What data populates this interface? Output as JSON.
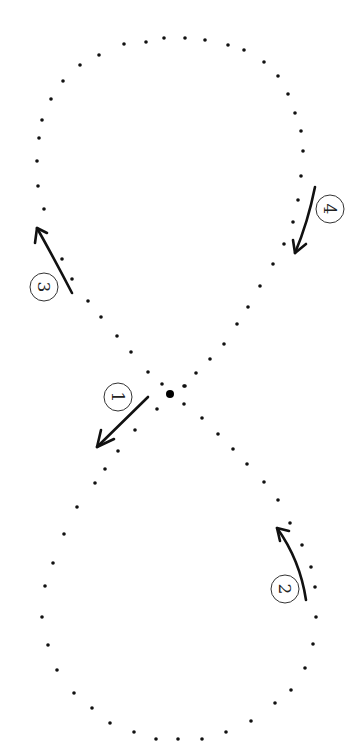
{
  "diagram": {
    "type": "figure-eight-path",
    "colors": {
      "ink": "#111111",
      "background": "#ffffff",
      "circle_stroke": "#333333"
    },
    "center_point": {
      "x": 170,
      "y": 394,
      "r": 4
    },
    "dot_radius": 1.8,
    "dots": [
      [
        124,
        44
      ],
      [
        146,
        42
      ],
      [
        164,
        38
      ],
      [
        185,
        38
      ],
      [
        205,
        40
      ],
      [
        228,
        45
      ],
      [
        244,
        50
      ],
      [
        264,
        62
      ],
      [
        278,
        76
      ],
      [
        288,
        94
      ],
      [
        295,
        113
      ],
      [
        301,
        131
      ],
      [
        303,
        151
      ],
      [
        301,
        176
      ],
      [
        298,
        200
      ],
      [
        293,
        222
      ],
      [
        284,
        244
      ],
      [
        273,
        264
      ],
      [
        260,
        286
      ],
      [
        248,
        307
      ],
      [
        237,
        324
      ],
      [
        224,
        344
      ],
      [
        210,
        359
      ],
      [
        196,
        373
      ],
      [
        184,
        386
      ],
      [
        99,
        55
      ],
      [
        80,
        65
      ],
      [
        63,
        81
      ],
      [
        51,
        99
      ],
      [
        42,
        120
      ],
      [
        39,
        138
      ],
      [
        37,
        161
      ],
      [
        38,
        186
      ],
      [
        44,
        209
      ],
      [
        62,
        259
      ],
      [
        72,
        279
      ],
      [
        88,
        301
      ],
      [
        101,
        317
      ],
      [
        117,
        336
      ],
      [
        131,
        352
      ],
      [
        148,
        372
      ],
      [
        162,
        384
      ],
      [
        185,
        386
      ],
      [
        184,
        404
      ],
      [
        157,
        409
      ],
      [
        135,
        430
      ],
      [
        118,
        451
      ],
      [
        105,
        469
      ],
      [
        95,
        483
      ],
      [
        77,
        507
      ],
      [
        64,
        534
      ],
      [
        53,
        563
      ],
      [
        202,
        418
      ],
      [
        218,
        434
      ],
      [
        233,
        449
      ],
      [
        247,
        464
      ],
      [
        264,
        482
      ],
      [
        278,
        500
      ],
      [
        290,
        523
      ],
      [
        302,
        545
      ],
      [
        311,
        567
      ],
      [
        45,
        586
      ],
      [
        42,
        617
      ],
      [
        48,
        645
      ],
      [
        57,
        670
      ],
      [
        74,
        693
      ],
      [
        92,
        708
      ],
      [
        110,
        723
      ],
      [
        134,
        732
      ],
      [
        156,
        739
      ],
      [
        178,
        739
      ],
      [
        202,
        739
      ],
      [
        226,
        732
      ],
      [
        251,
        721
      ],
      [
        275,
        703
      ],
      [
        291,
        690
      ],
      [
        305,
        668
      ],
      [
        313,
        644
      ],
      [
        316,
        617
      ],
      [
        315,
        587
      ]
    ],
    "markers": [
      {
        "id": "1",
        "label": "1",
        "cx": 118,
        "cy": 397,
        "rotate": 90,
        "arrow": {
          "path": "M 148 397 L 97 447",
          "head": "M 97 447 L 101 430 M 97 447 L 114 439"
        }
      },
      {
        "id": "2",
        "label": "2",
        "cx": 285,
        "cy": 589,
        "rotate": 90,
        "arrow": {
          "path": "M 306 600 Q 300 560 277 528",
          "head": "M 277 528 L 289 531 M 277 528 L 280 541"
        }
      },
      {
        "id": "3",
        "label": "3",
        "cx": 44,
        "cy": 287,
        "rotate": 90,
        "arrow": {
          "path": "M 72 293 Q 56 262 37 228",
          "head": "M 37 228 L 35 243 M 37 228 L 47 233"
        }
      },
      {
        "id": "4",
        "label": "4",
        "cx": 330,
        "cy": 209,
        "rotate": 90,
        "arrow": {
          "path": "M 315 187 Q 308 222 295 253",
          "head": "M 295 253 L 293 240 M 295 253 L 306 244"
        }
      }
    ]
  }
}
